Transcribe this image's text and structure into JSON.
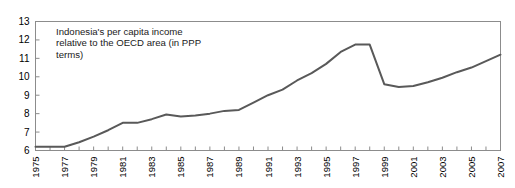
{
  "chart_data": {
    "type": "line",
    "title": "",
    "annotation": "Indonesia's per capita income relative to the OECD area (in PPP terms)",
    "xlabel": "",
    "ylabel": "",
    "xlim": [
      1975,
      2007
    ],
    "ylim": [
      6,
      13
    ],
    "ytick_step": 1,
    "grid": false,
    "legend": false,
    "line_color": "#595959",
    "axis_color": "#8c8c8c",
    "yticks": [
      "13",
      "12",
      "11",
      "10",
      "9",
      "8",
      "7",
      "6"
    ],
    "xticks": [
      "1975",
      "1977",
      "1979",
      "1981",
      "1983",
      "1985",
      "1987",
      "1989",
      "1991",
      "1993",
      "1995",
      "1997",
      "1999",
      "2001",
      "2003",
      "2005",
      "2007"
    ],
    "x": [
      1975,
      1976,
      1977,
      1978,
      1979,
      1980,
      1981,
      1982,
      1983,
      1984,
      1985,
      1986,
      1987,
      1988,
      1989,
      1990,
      1991,
      1992,
      1993,
      1994,
      1995,
      1996,
      1997,
      1998,
      1999,
      2000,
      2001,
      2002,
      2003,
      2004,
      2005,
      2006,
      2007
    ],
    "values": [
      6.2,
      6.2,
      6.2,
      6.45,
      6.75,
      7.1,
      7.5,
      7.5,
      7.7,
      7.95,
      7.85,
      7.9,
      8.0,
      8.15,
      8.2,
      8.6,
      9.0,
      9.3,
      9.8,
      10.2,
      10.7,
      11.35,
      11.75,
      11.75,
      9.6,
      9.45,
      9.5,
      9.7,
      9.95,
      10.25,
      10.5,
      10.85,
      11.2
    ],
    "series": [
      {
        "name": "Indonesia per capita income relative to OECD area (PPP)",
        "values": [
          6.2,
          6.2,
          6.2,
          6.45,
          6.75,
          7.1,
          7.5,
          7.5,
          7.7,
          7.95,
          7.85,
          7.9,
          8.0,
          8.15,
          8.2,
          8.6,
          9.0,
          9.3,
          9.8,
          10.2,
          10.7,
          11.35,
          11.75,
          11.75,
          9.6,
          9.45,
          9.5,
          9.7,
          9.95,
          10.25,
          10.5,
          10.85,
          11.2
        ]
      }
    ]
  }
}
